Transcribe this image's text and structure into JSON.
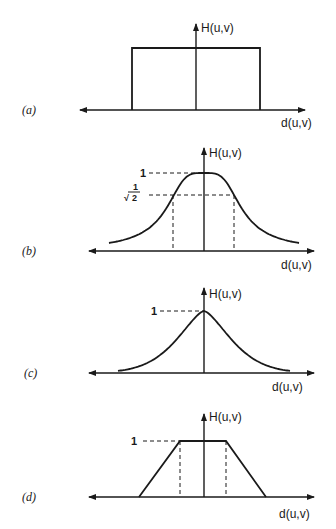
{
  "figure": {
    "panels": [
      {
        "id": "a",
        "label": "(a)",
        "type": "ideal",
        "y_label": "H(u,v)",
        "x_label": "d(u,v)"
      },
      {
        "id": "b",
        "label": "(b)",
        "type": "butterworth",
        "y_label": "H(u,v)",
        "x_label": "d(u,v)",
        "marks": {
          "peak": "1",
          "half_power_num": "1",
          "half_power_den": "2",
          "half_power_root": "√"
        }
      },
      {
        "id": "c",
        "label": "(c)",
        "type": "exponential",
        "y_label": "H(u,v)",
        "x_label": "d(u,v)",
        "marks": {
          "peak": "1"
        }
      },
      {
        "id": "d",
        "label": "(d)",
        "type": "trapezoidal",
        "y_label": "H(u,v)",
        "x_label": "d(u,v)",
        "marks": {
          "peak": "1"
        }
      }
    ]
  }
}
